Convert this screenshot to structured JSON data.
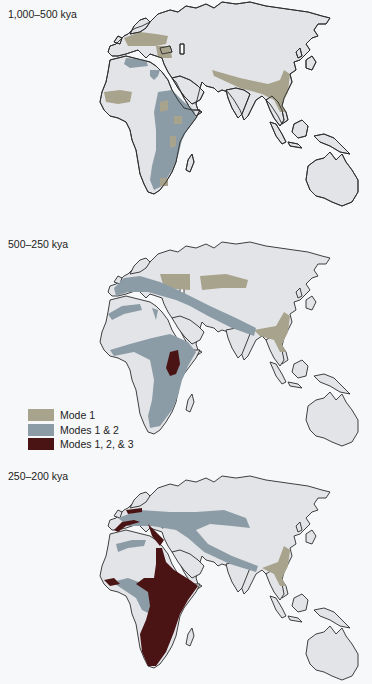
{
  "figure": {
    "panels": [
      {
        "id": "panel-1",
        "label": "1,000–500 kya"
      },
      {
        "id": "panel-2",
        "label": "500–250 kya"
      },
      {
        "id": "panel-3",
        "label": "250–200 kya"
      }
    ],
    "legend": {
      "items": [
        {
          "label": "Mode 1",
          "color": "#a8a38c"
        },
        {
          "label": "Modes 1 & 2",
          "color": "#8c9ca6"
        },
        {
          "label": "Modes 1, 2, & 3",
          "color": "#4a1414"
        }
      ]
    },
    "colors": {
      "land": "#e3e4e8",
      "coastline": "#2b2b2b",
      "background": "#f7f8fa",
      "mode1": "#a8a38c",
      "modes12": "#8c9ca6",
      "modes123": "#4a1414"
    }
  }
}
